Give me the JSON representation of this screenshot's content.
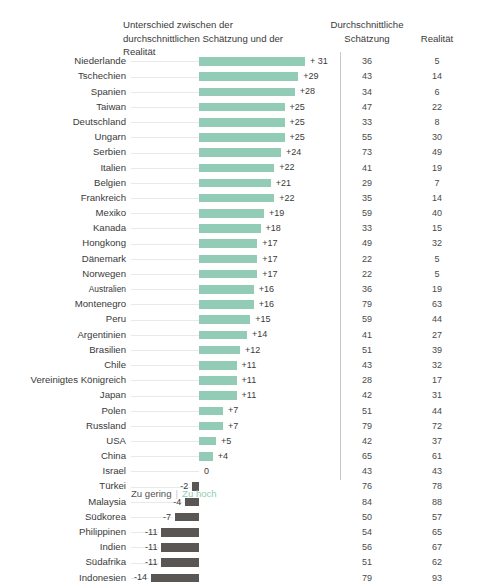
{
  "header": {
    "diff_title": "Unterschied zwischen der durchschnittlichen Schätzung und der Realität",
    "estimate_title": "Durchschnittliche Schätzung",
    "reality_title": "Realität"
  },
  "legend": {
    "too_low": "Zu gering",
    "too_high": "Zu hoch"
  },
  "colors": {
    "positive_bar": "#92cbb6",
    "negative_bar": "#5a5653",
    "leader_line": "#e9e9e9",
    "divider": "#c9c9c9",
    "text": "#3a3a3a"
  },
  "chart_data": {
    "type": "bar",
    "title": "Unterschied zwischen der durchschnittlichen Schätzung und der Realität",
    "xlabel": "",
    "ylabel": "",
    "orientation": "horizontal",
    "grid": false,
    "legend_position": "bottom",
    "columns": [
      "Land",
      "Unterschied",
      "Durchschnittliche Schätzung",
      "Realität"
    ],
    "categories": [
      "Niederlande",
      "Tschechien",
      "Spanien",
      "Taiwan",
      "Deutschland",
      "Ungarn",
      "Serbien",
      "Italien",
      "Belgien",
      "Frankreich",
      "Mexiko",
      "Kanada",
      "Hongkong",
      "Dänemark",
      "Norwegen",
      "Australien",
      "Montenegro",
      "Peru",
      "Argentinien",
      "Brasilien",
      "Chile",
      "Vereinigtes Königreich",
      "Japan",
      "Polen",
      "Russland",
      "USA",
      "China",
      "Israel",
      "Türkei",
      "Malaysia",
      "Südkorea",
      "Philippinen",
      "Indien",
      "Südafrika",
      "Indonesien"
    ],
    "values": [
      31,
      29,
      28,
      25,
      25,
      25,
      24,
      22,
      21,
      22,
      19,
      18,
      17,
      17,
      17,
      16,
      16,
      15,
      14,
      12,
      11,
      11,
      11,
      7,
      7,
      5,
      4,
      0,
      -2,
      -4,
      -7,
      -11,
      -11,
      -11,
      -14
    ],
    "value_labels": [
      "+ 31",
      "+29",
      "+28",
      "+25",
      "+25",
      "+25",
      "+24",
      "+22",
      "+21",
      "+22",
      "+19",
      "+18",
      "+17",
      "+17",
      "+17",
      "+16",
      "+16",
      "+15",
      "+14",
      "+12",
      "+11",
      "+11",
      "+11",
      "+7",
      "+7",
      "+5",
      "+4",
      "0",
      "-2",
      "-4",
      "-7",
      "-11",
      "-11",
      "-11",
      "-14"
    ],
    "series": [
      {
        "name": "Durchschnittliche Schätzung",
        "values": [
          36,
          43,
          34,
          47,
          33,
          55,
          73,
          41,
          29,
          35,
          59,
          33,
          49,
          22,
          22,
          36,
          79,
          59,
          41,
          51,
          43,
          28,
          42,
          51,
          79,
          42,
          65,
          43,
          76,
          84,
          50,
          54,
          56,
          51,
          79
        ]
      },
      {
        "name": "Realität",
        "values": [
          5,
          14,
          6,
          22,
          8,
          30,
          49,
          19,
          7,
          14,
          40,
          15,
          32,
          5,
          5,
          19,
          63,
          44,
          27,
          39,
          32,
          17,
          31,
          44,
          72,
          37,
          61,
          43,
          78,
          88,
          57,
          65,
          67,
          62,
          93
        ]
      }
    ],
    "xlim": [
      -14,
      31
    ]
  },
  "rows": [
    {
      "label": "Niederlande",
      "value": 31,
      "value_label": "+ 31",
      "est": "36",
      "real": "5"
    },
    {
      "label": "Tschechien",
      "value": 29,
      "value_label": "+29",
      "est": "43",
      "real": "14"
    },
    {
      "label": "Spanien",
      "value": 28,
      "value_label": "+28",
      "est": "34",
      "real": "6"
    },
    {
      "label": "Taiwan",
      "value": 25,
      "value_label": "+25",
      "est": "47",
      "real": "22"
    },
    {
      "label": "Deutschland",
      "value": 25,
      "value_label": "+25",
      "est": "33",
      "real": "8"
    },
    {
      "label": "Ungarn",
      "value": 25,
      "value_label": "+25",
      "est": "55",
      "real": "30"
    },
    {
      "label": "Serbien",
      "value": 24,
      "value_label": "+24",
      "est": "73",
      "real": "49"
    },
    {
      "label": "Italien",
      "value": 22,
      "value_label": "+22",
      "est": "41",
      "real": "19"
    },
    {
      "label": "Belgien",
      "value": 21,
      "value_label": "+21",
      "est": "29",
      "real": "7"
    },
    {
      "label": "Frankreich",
      "value": 22,
      "value_label": "+22",
      "est": "35",
      "real": "14"
    },
    {
      "label": "Mexiko",
      "value": 19,
      "value_label": "+19",
      "est": "59",
      "real": "40"
    },
    {
      "label": "Kanada",
      "value": 18,
      "value_label": "+18",
      "est": "33",
      "real": "15"
    },
    {
      "label": "Hongkong",
      "value": 17,
      "value_label": "+17",
      "est": "49",
      "real": "32"
    },
    {
      "label": "Dänemark",
      "value": 17,
      "value_label": "+17",
      "est": "22",
      "real": "5"
    },
    {
      "label": "Norwegen",
      "value": 17,
      "value_label": "+17",
      "est": "22",
      "real": "5"
    },
    {
      "label": "Australien",
      "value": 16,
      "value_label": "+16",
      "est": "36",
      "real": "19",
      "small": true
    },
    {
      "label": "Montenegro",
      "value": 16,
      "value_label": "+16",
      "est": "79",
      "real": "63"
    },
    {
      "label": "Peru",
      "value": 15,
      "value_label": "+15",
      "est": "59",
      "real": "44"
    },
    {
      "label": "Argentinien",
      "value": 14,
      "value_label": "+14",
      "est": "41",
      "real": "27"
    },
    {
      "label": "Brasilien",
      "value": 12,
      "value_label": "+12",
      "est": "51",
      "real": "39"
    },
    {
      "label": "Chile",
      "value": 11,
      "value_label": "+11",
      "est": "43",
      "real": "32"
    },
    {
      "label": "Vereinigtes Königreich",
      "value": 11,
      "value_label": "+11",
      "est": "28",
      "real": "17"
    },
    {
      "label": "Japan",
      "value": 11,
      "value_label": "+11",
      "est": "42",
      "real": "31"
    },
    {
      "label": "Polen",
      "value": 7,
      "value_label": "+7",
      "est": "51",
      "real": "44"
    },
    {
      "label": "Russland",
      "value": 7,
      "value_label": "+7",
      "est": "79",
      "real": "72"
    },
    {
      "label": "USA",
      "value": 5,
      "value_label": "+5",
      "est": "42",
      "real": "37"
    },
    {
      "label": "China",
      "value": 4,
      "value_label": "+4",
      "est": "65",
      "real": "61"
    },
    {
      "label": "Israel",
      "value": 0,
      "value_label": "0",
      "est": "43",
      "real": "43"
    },
    {
      "label": "Türkei",
      "value": -2,
      "value_label": "-2",
      "est": "76",
      "real": "78"
    },
    {
      "label": "Malaysia",
      "value": -4,
      "value_label": "-4",
      "est": "84",
      "real": "88"
    },
    {
      "label": "Südkorea",
      "value": -7,
      "value_label": "-7",
      "est": "50",
      "real": "57"
    },
    {
      "label": "Philippinen",
      "value": -11,
      "value_label": "-11",
      "est": "54",
      "real": "65"
    },
    {
      "label": "Indien",
      "value": -11,
      "value_label": "-11",
      "est": "56",
      "real": "67"
    },
    {
      "label": "Südafrika",
      "value": -11,
      "value_label": "-11",
      "est": "51",
      "real": "62"
    },
    {
      "label": "Indonesien",
      "value": -14,
      "value_label": "-14",
      "est": "79",
      "real": "93"
    }
  ]
}
